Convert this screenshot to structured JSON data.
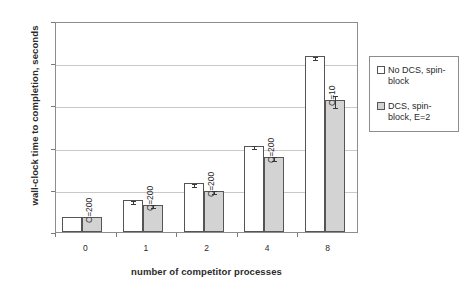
{
  "chart_data": {
    "type": "bar",
    "title": "",
    "xlabel": "number of competitor processes",
    "ylabel": "wall-clock time to completion, seconds",
    "categories": [
      "0",
      "1",
      "2",
      "4",
      "8"
    ],
    "ylim": [
      0,
      2500
    ],
    "yticks": [
      0,
      500,
      1000,
      1500,
      2000,
      2500
    ],
    "grid": true,
    "legend_position": "right",
    "series": [
      {
        "name": "No DCS, spin-block",
        "color": "#ffffff",
        "values": [
          175,
          375,
          580,
          1020,
          2085
        ],
        "errors": [
          0,
          5,
          8,
          12,
          18
        ]
      },
      {
        "name": "DCS, spin-block, E=2",
        "color": "#d3d3d3",
        "values": [
          175,
          325,
          490,
          885,
          1565
        ],
        "errors": [
          0,
          8,
          10,
          25,
          75
        ]
      }
    ],
    "annotations": [
      {
        "text": "C=200",
        "category": "0"
      },
      {
        "text": "C=200",
        "category": "1"
      },
      {
        "text": "C=200",
        "category": "2"
      },
      {
        "text": "C=200",
        "category": "4"
      },
      {
        "text": "C=10",
        "category": "8"
      }
    ]
  },
  "axis": {
    "ytick_labels": [
      "2500",
      "2000",
      "1500",
      "1000",
      "500",
      "0"
    ],
    "xtick_labels": [
      "0",
      "1",
      "2",
      "4",
      "8"
    ],
    "ylabel_text": "wall-clock time to completion, seconds",
    "xlabel_text": "number of competitor processes"
  },
  "legend": {
    "entries": [
      {
        "label": "No DCS, spin-block",
        "swatch": "white-square-icon"
      },
      {
        "label": "DCS, spin-block, E=2",
        "swatch": "gray-dotted-square-icon"
      }
    ]
  }
}
